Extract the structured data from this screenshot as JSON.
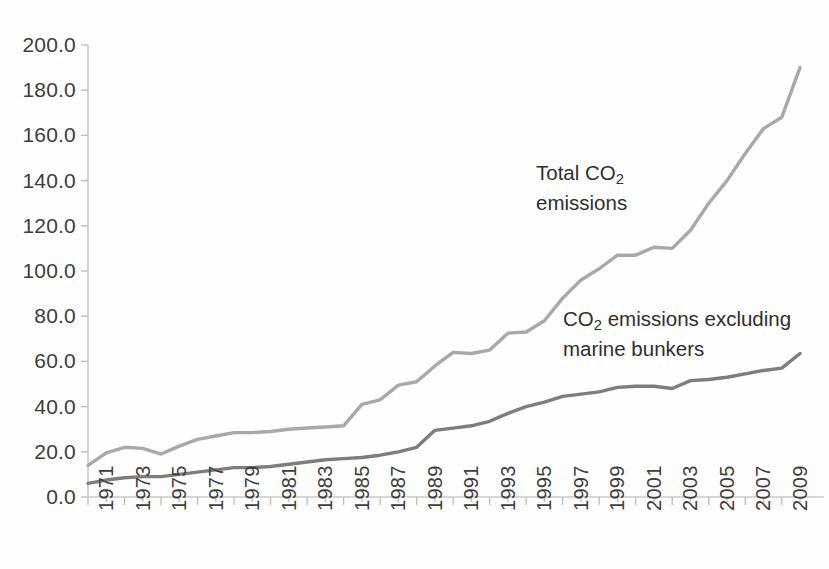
{
  "chart_data": {
    "type": "line",
    "title": "",
    "xlabel": "",
    "ylabel": "",
    "ylim": [
      0,
      200
    ],
    "ytick_step": 20,
    "grid": false,
    "legend_position": "inline-annotations",
    "x_range": [
      1971,
      2010
    ],
    "x_tick_labels": [
      "1971",
      "1973",
      "1975",
      "1977",
      "1979",
      "1981",
      "1983",
      "1985",
      "1987",
      "1989",
      "1991",
      "1993",
      "1995",
      "1997",
      "1999",
      "2001",
      "2003",
      "2005",
      "2007",
      "2009"
    ],
    "y_tick_labels": [
      "200.0",
      "180.0",
      "160.0",
      "140.0",
      "120.0",
      "100.0",
      "80.0",
      "60.0",
      "40.0",
      "20.0",
      "0.0"
    ],
    "x": [
      1971,
      1972,
      1973,
      1974,
      1975,
      1976,
      1977,
      1978,
      1979,
      1980,
      1981,
      1982,
      1983,
      1984,
      1985,
      1986,
      1987,
      1988,
      1989,
      1990,
      1991,
      1992,
      1993,
      1994,
      1995,
      1996,
      1997,
      1998,
      1999,
      2000,
      2001,
      2002,
      2003,
      2004,
      2005,
      2006,
      2007,
      2008,
      2009,
      2010
    ],
    "series": [
      {
        "name": "Total CO2 emissions",
        "color": "#a8a8a8",
        "values": [
          14.0,
          19.5,
          22.0,
          21.5,
          19.0,
          22.5,
          25.5,
          27.0,
          28.5,
          28.5,
          29.0,
          30.0,
          30.5,
          31.0,
          31.5,
          41.0,
          43.0,
          49.5,
          51.0,
          58.0,
          64.0,
          63.5,
          65.0,
          72.5,
          73.0,
          78.0,
          88.0,
          96.0,
          101.0,
          107.0,
          107.0,
          110.5,
          110.0,
          118.0,
          130.0,
          140.0,
          152.0,
          163.0,
          168.0,
          190.0
        ]
      },
      {
        "name": "CO2 emissions excluding marine bunkers",
        "color": "#7d7d7d",
        "values": [
          6.0,
          7.5,
          8.5,
          9.0,
          9.0,
          10.0,
          11.0,
          12.0,
          13.0,
          13.0,
          13.5,
          14.5,
          15.5,
          16.5,
          17.0,
          17.5,
          18.5,
          20.0,
          22.0,
          29.5,
          30.5,
          31.5,
          33.5,
          37.0,
          40.0,
          42.0,
          44.5,
          45.5,
          46.5,
          48.5,
          49.0,
          49.0,
          48.0,
          51.5,
          52.0,
          53.0,
          54.5,
          56.0,
          57.0,
          63.5
        ]
      }
    ],
    "annotations": [
      {
        "id": "total-co2-label",
        "text_line1_prefix": "Total CO",
        "text_line1_sub": "2",
        "text_line1_suffix": "",
        "text_line2": "emissions"
      },
      {
        "id": "excluding-bunkers-label",
        "text_line1_prefix": "CO",
        "text_line1_sub": "2",
        "text_line1_suffix": " emissions excluding",
        "text_line2": "marine bunkers"
      }
    ]
  },
  "axes": {
    "axis_color": "#c9c9c9",
    "tick_color": "#bdbdbd"
  }
}
